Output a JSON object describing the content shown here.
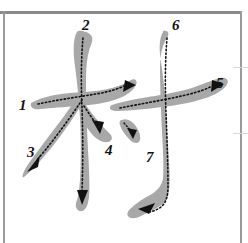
{
  "page": {
    "character": "村",
    "background_color": "#ffffff",
    "stroke_fill_color": "#a8a8a8",
    "guide_line_color": "#8a8a8a",
    "path_color": "#111111",
    "label_color": "#111111",
    "total_strokes": 7
  },
  "rules": {
    "top_horizontal": "horizontal-rule-top",
    "left_vertical": "vertical-rule-left",
    "right_vertical": "vertical-rule-right",
    "right_tick_upper": "faint-rule-right-upper",
    "right_tick_lower": "faint-rule-right-lower"
  },
  "strokes": [
    {
      "num": "1",
      "name": "stroke-1-horizontal-left",
      "label_x": 19,
      "label_y": 98
    },
    {
      "num": "2",
      "name": "stroke-2-vertical-left",
      "label_x": 82,
      "label_y": 18
    },
    {
      "num": "3",
      "name": "stroke-3-left-falling",
      "label_x": 27,
      "label_y": 145
    },
    {
      "num": "4",
      "name": "stroke-4-right-falling",
      "label_x": 105,
      "label_y": 143
    },
    {
      "num": "5",
      "name": "stroke-5-horizontal-right",
      "label_x": 216,
      "label_y": 76
    },
    {
      "num": "6",
      "name": "stroke-6-vertical-hook-right",
      "label_x": 172,
      "label_y": 18
    },
    {
      "num": "7",
      "name": "stroke-7-dot",
      "label_x": 146,
      "label_y": 150
    }
  ],
  "labels": {
    "one": "1",
    "two": "2",
    "three": "3",
    "four": "4",
    "five": "5",
    "six": "6",
    "seven": "7"
  }
}
